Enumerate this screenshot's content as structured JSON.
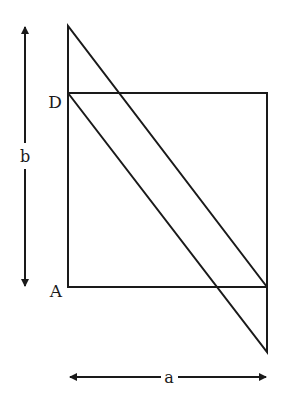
{
  "figure": {
    "width": 281,
    "height": 395,
    "stroke_color": "#1a1a1a",
    "background": "#ffffff"
  },
  "labels": {
    "corner_d": "D",
    "corner_a": "A",
    "dimension_b": "b",
    "dimension_a": "a"
  },
  "shapes": {
    "rectangle": {
      "x": 68,
      "y": 93,
      "width": 199,
      "height": 194,
      "name": "square ABCD"
    },
    "parallelogram": {
      "points": [
        [
          68,
          26
        ],
        [
          68,
          93
        ],
        [
          267,
          352
        ],
        [
          267,
          287
        ]
      ],
      "description": "sheared copy of the square, top edge at x=68 shifted up, bottom edge at x=267 shifted down"
    }
  },
  "dimensions": {
    "b": {
      "orientation": "vertical",
      "x": 25,
      "from_y": 25,
      "to_y": 288,
      "label_y": 157
    },
    "a": {
      "orientation": "horizontal",
      "y": 377,
      "from_x": 68,
      "to_x": 268,
      "label_x": 169
    }
  }
}
